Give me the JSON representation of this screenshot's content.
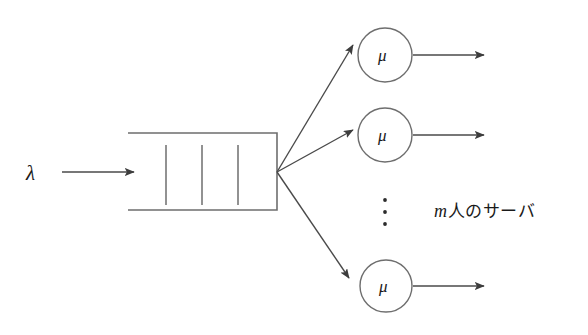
{
  "figure": {
    "type": "queueing-system-diagram",
    "background_color": "#ffffff",
    "stroke_color": "#4a4a4a",
    "text_color": "#1a1a1a"
  },
  "arrival": {
    "symbol": "λ",
    "arrow_name": "arrival-arrow"
  },
  "queue": {
    "name": "queue-buffer",
    "divider_count": 3,
    "open_side": "left"
  },
  "servers": [
    {
      "symbol": "μ",
      "index": 1
    },
    {
      "symbol": "μ",
      "index": 2
    },
    {
      "symbol": "μ",
      "index": 3
    }
  ],
  "ellipsis": {
    "glyph": "⋮",
    "dot_count": 3
  },
  "annotation": {
    "variable": "m",
    "text": "人のサーバ",
    "full_text": "m 人のサーバ"
  }
}
